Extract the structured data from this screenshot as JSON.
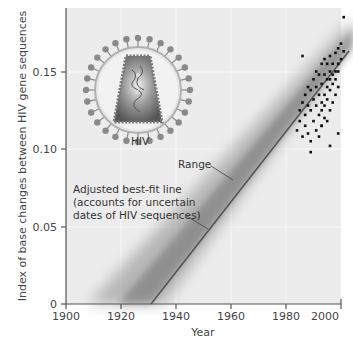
{
  "chart_data": {
    "type": "scatter",
    "title": "",
    "xlabel": "Year",
    "ylabel": "Index of base changes between HIV gene sequences",
    "xlim": [
      1900,
      2003
    ],
    "ylim": [
      0,
      0.19
    ],
    "x_ticks": [
      "1900",
      "1920",
      "1940",
      "1960",
      "1980",
      "2000"
    ],
    "y_ticks": [
      "0",
      "0.05",
      "0.10",
      "0.15"
    ],
    "grid": true,
    "annotations": {
      "virus_label": "HIV",
      "range_label": "Range",
      "fit_label_lines": [
        "Adjusted best-fit line",
        "(accounts for uncertain",
        "dates of HIV sequences)"
      ]
    },
    "best_fit_line": {
      "x": [
        1931,
        2003
      ],
      "y": [
        0,
        0.163
      ]
    },
    "range_band": {
      "description": "shaded uncertainty band around best-fit line, widening toward earlier years"
    },
    "series": [
      {
        "name": "HIV sequences",
        "x": [
          1984,
          1985,
          1985,
          1986,
          1986,
          1987,
          1987,
          1987,
          1988,
          1988,
          1988,
          1989,
          1989,
          1989,
          1990,
          1990,
          1990,
          1991,
          1991,
          1991,
          1991,
          1992,
          1992,
          1992,
          1992,
          1993,
          1993,
          1993,
          1993,
          1993,
          1994,
          1994,
          1994,
          1994,
          1994,
          1995,
          1995,
          1995,
          1995,
          1995,
          1996,
          1996,
          1996,
          1996,
          1996,
          1997,
          1997,
          1997,
          1997,
          1998,
          1998,
          1998,
          1998,
          1999,
          1999,
          1999,
          1999,
          2000,
          2000,
          2001,
          1986,
          1989,
          1993,
          1996,
          1999,
          2001
        ],
        "y": [
          0.112,
          0.118,
          0.125,
          0.108,
          0.13,
          0.115,
          0.122,
          0.135,
          0.11,
          0.128,
          0.14,
          0.105,
          0.125,
          0.138,
          0.118,
          0.132,
          0.145,
          0.112,
          0.128,
          0.14,
          0.15,
          0.108,
          0.122,
          0.135,
          0.148,
          0.115,
          0.13,
          0.142,
          0.155,
          0.125,
          0.12,
          0.135,
          0.148,
          0.158,
          0.128,
          0.118,
          0.132,
          0.145,
          0.155,
          0.14,
          0.125,
          0.138,
          0.15,
          0.16,
          0.145,
          0.13,
          0.142,
          0.155,
          0.148,
          0.135,
          0.15,
          0.162,
          0.145,
          0.14,
          0.155,
          0.165,
          0.15,
          0.158,
          0.168,
          0.163,
          0.16,
          0.098,
          0.115,
          0.102,
          0.11,
          0.185
        ]
      }
    ]
  }
}
